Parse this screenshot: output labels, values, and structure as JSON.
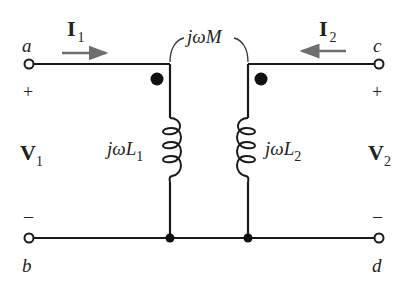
{
  "diagram": {
    "type": "mutually-coupled-inductors",
    "colors": {
      "wire": "#1a1a1a",
      "arrow": "#6e6e6e",
      "text": "#222222",
      "background": "#ffffff"
    },
    "terminals": [
      {
        "id": "a",
        "label": "a",
        "polarity": "+"
      },
      {
        "id": "b",
        "label": "b",
        "polarity": "–"
      },
      {
        "id": "c",
        "label": "c",
        "polarity": "+"
      },
      {
        "id": "d",
        "label": "d",
        "polarity": "–"
      }
    ],
    "currents": [
      {
        "name": "I",
        "sub": "1",
        "direction": "right"
      },
      {
        "name": "I",
        "sub": "2",
        "direction": "left"
      }
    ],
    "voltages": [
      {
        "name": "V",
        "sub": "1"
      },
      {
        "name": "V",
        "sub": "2"
      }
    ],
    "inductors": [
      {
        "prefix": "jω",
        "name": "L",
        "sub": "1"
      },
      {
        "prefix": "jω",
        "name": "L",
        "sub": "2"
      }
    ],
    "mutual": {
      "prefix": "jω",
      "name": "M"
    },
    "plus": "+",
    "minus": "–"
  }
}
